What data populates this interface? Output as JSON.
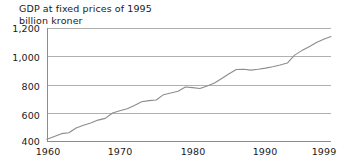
{
  "chart_data": {
    "type": "line",
    "title": "GDP at fixed prices of 1995",
    "subtitle": "billion kroner",
    "title_lines": [
      "GDP at fixed prices of 1995",
      "billion kroner"
    ],
    "xlabel": "",
    "ylabel": "billion kroner",
    "xlim": [
      1960,
      1999
    ],
    "ylim": [
      400,
      1200
    ],
    "grid": true,
    "legend": "none",
    "line_color": "#8c8c8c",
    "grid_color": "#b0b0b0",
    "axis_color": "#8c8c8c",
    "text_color": "#1a1a1a",
    "yticks": [
      400,
      600,
      800,
      1000,
      1200
    ],
    "ytick_labels": [
      "400",
      "600",
      "800",
      "1,000",
      "1,200"
    ],
    "xticks": [
      1960,
      1970,
      1980,
      1990,
      1999
    ],
    "xtick_labels": [
      "1960",
      "1970",
      "1980",
      "1990",
      "1999"
    ],
    "x": [
      1960,
      1961,
      1962,
      1963,
      1964,
      1965,
      1966,
      1967,
      1968,
      1969,
      1970,
      1971,
      1972,
      1973,
      1974,
      1975,
      1976,
      1977,
      1978,
      1979,
      1980,
      1981,
      1982,
      1983,
      1984,
      1985,
      1986,
      1987,
      1988,
      1989,
      1990,
      1991,
      1992,
      1993,
      1994,
      1995,
      1996,
      1997,
      1998,
      1999
    ],
    "values": [
      412,
      432,
      452,
      458,
      492,
      512,
      528,
      548,
      560,
      598,
      614,
      628,
      652,
      678,
      686,
      690,
      728,
      740,
      752,
      782,
      778,
      772,
      790,
      810,
      842,
      876,
      906,
      908,
      902,
      908,
      916,
      926,
      938,
      952,
      1008,
      1040,
      1068,
      1098,
      1120,
      1140
    ]
  }
}
